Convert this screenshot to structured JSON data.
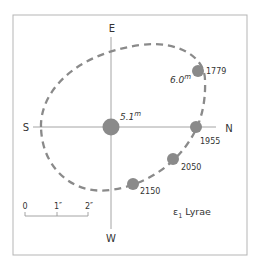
{
  "diagram": {
    "title_main": "ε",
    "title_sub": "1",
    "title_rest": "Lyrae",
    "compass": {
      "north": "N",
      "south": "S",
      "east": "E",
      "west": "W"
    },
    "primary": {
      "magnitude": "5.1",
      "magnitude_sup": "m"
    },
    "companion": {
      "magnitude": "6.0",
      "magnitude_sup": "m"
    },
    "positions": [
      {
        "year": "1779"
      },
      {
        "year": "1955"
      },
      {
        "year": "2050"
      },
      {
        "year": "2150"
      }
    ],
    "scale": {
      "ticks": [
        "0",
        "1″",
        "2″"
      ]
    },
    "colors": {
      "star": "#8a8a8a",
      "orbit": "#8a8a8a",
      "axis": "#9a9a9a",
      "frame": "#b5b5b5",
      "text": "#333333"
    }
  }
}
